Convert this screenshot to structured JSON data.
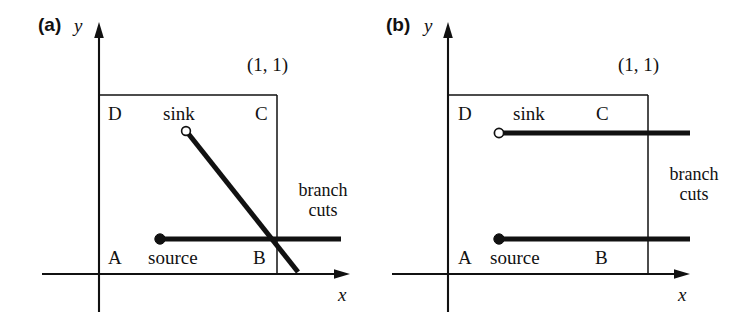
{
  "figure": {
    "type": "diagram",
    "title": "",
    "background_color": "#ffffff",
    "line_color": "#111111"
  },
  "panels": [
    {
      "tag": "(a)",
      "axis_y_label": "y",
      "axis_x_label": "x",
      "coord_label": "(1, 1)",
      "corner_labels": {
        "a": "A",
        "b": "B",
        "c": "C",
        "d": "D"
      },
      "point_labels": {
        "source": "source",
        "sink": "sink"
      },
      "branch_cuts_label_line1": "branch",
      "branch_cuts_label_line2": "cuts",
      "markers": {
        "source": {
          "style": "filled-circle",
          "x": 0.42,
          "y": 0.32
        },
        "sink": {
          "style": "open-circle",
          "x": 0.47,
          "y": 0.78
        }
      },
      "branch_cuts": [
        {
          "from_marker": "source",
          "direction": "horizontal-right",
          "shape": "straight"
        },
        {
          "from_marker": "sink",
          "direction": "down-right",
          "shape": "diagonal"
        }
      ]
    },
    {
      "tag": "(b)",
      "axis_y_label": "y",
      "axis_x_label": "x",
      "coord_label": "(1, 1)",
      "corner_labels": {
        "a": "A",
        "b": "B",
        "c": "C",
        "d": "D"
      },
      "point_labels": {
        "source": "source",
        "sink": "sink"
      },
      "branch_cuts_label_line1": "branch",
      "branch_cuts_label_line2": "cuts",
      "markers": {
        "source": {
          "style": "filled-circle",
          "x": 0.26,
          "y": 0.32
        },
        "sink": {
          "style": "open-circle",
          "x": 0.26,
          "y": 0.78
        }
      },
      "branch_cuts": [
        {
          "from_marker": "source",
          "direction": "horizontal-right",
          "shape": "straight"
        },
        {
          "from_marker": "sink",
          "direction": "horizontal-right",
          "shape": "straight"
        }
      ]
    }
  ]
}
